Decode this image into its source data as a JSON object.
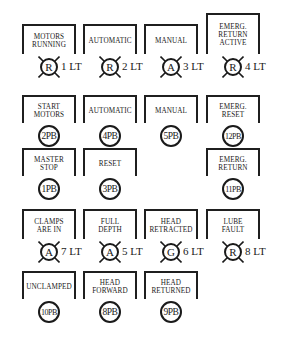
{
  "panel": {
    "rows": [
      {
        "type": "lamp",
        "items": [
          {
            "label": "MOTORS\nRUNNING",
            "letter": "R",
            "tag": "1 LT"
          },
          {
            "label": "AUTOMATIC",
            "letter": "R",
            "tag": "2 LT"
          },
          {
            "label": "MANUAL",
            "letter": "A",
            "tag": "3 LT"
          },
          {
            "label": "EMERG.\nRETURN\nACTIVE",
            "letter": "R",
            "tag": "4 LT"
          }
        ]
      },
      {
        "type": "pushbutton",
        "items": [
          {
            "label": "START\nMOTORS",
            "tag": "2PB"
          },
          {
            "label": "AUTOMATIC",
            "tag": "4PB"
          },
          {
            "label": "MANUAL",
            "tag": "5PB"
          },
          {
            "label": "EMERG.\nRESET",
            "tag": "12PB"
          }
        ]
      },
      {
        "type": "pushbutton",
        "items": [
          {
            "label": "MASTER\nSTOP",
            "tag": "1PB"
          },
          {
            "label": "RESET",
            "tag": "3PB"
          },
          {
            "label": "EMERG.\nRETURN",
            "tag": "11PB"
          }
        ]
      },
      {
        "type": "lamp",
        "items": [
          {
            "label": "CLAMPS\nARE IN",
            "letter": "A",
            "tag": "7 LT"
          },
          {
            "label": "FULL\nDEPTH",
            "letter": "A",
            "tag": "5 LT"
          },
          {
            "label": "HEAD\nRETRACTED",
            "letter": "G",
            "tag": "6 LT"
          },
          {
            "label": "LUBE\nFAULT",
            "letter": "R",
            "tag": "8 LT"
          }
        ]
      },
      {
        "type": "pushbutton",
        "items": [
          {
            "label": "UNCLAMPED",
            "tag": "10PB"
          },
          {
            "label": "HEAD\nFORWARD",
            "tag": "8PB"
          },
          {
            "label": "HEAD\nRETURNED",
            "tag": "9PB"
          }
        ]
      }
    ]
  }
}
